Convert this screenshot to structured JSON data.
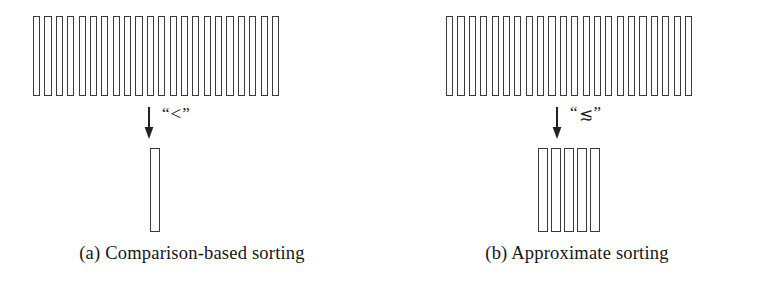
{
  "figure": {
    "background_color": "#ffffff",
    "ink_color": "#3a3a3a",
    "panels": [
      {
        "id": "a",
        "caption": "(a) Comparison-based sorting",
        "input_bar_count": 22,
        "output_bar_count": 1,
        "arrow_icon": "down-arrow-icon",
        "relation_open_quote": "“",
        "relation_symbol": "<",
        "relation_close_quote": "”",
        "relation_label": "“<”"
      },
      {
        "id": "b",
        "caption": "(b) Approximate sorting",
        "input_bar_count": 22,
        "output_bar_count": 5,
        "arrow_icon": "down-arrow-icon",
        "relation_open_quote": "“",
        "relation_symbol": "≲",
        "relation_close_quote": "”",
        "relation_label": "“≲”"
      }
    ]
  },
  "chart_data": {
    "type": "bar",
    "title": "",
    "xlabel": "",
    "ylabel": "",
    "series": [
      {
        "name": "(a) input array",
        "values": [
          80,
          80,
          80,
          80,
          80,
          80,
          80,
          80,
          80,
          80,
          80,
          80,
          80,
          80,
          80,
          80,
          80,
          80,
          80,
          80,
          80,
          80
        ]
      },
      {
        "name": "(a) output array",
        "values": [
          84
        ]
      },
      {
        "name": "(b) input array",
        "values": [
          80,
          80,
          80,
          80,
          80,
          80,
          80,
          80,
          80,
          80,
          80,
          80,
          80,
          80,
          80,
          80,
          80,
          80,
          80,
          80,
          80,
          80
        ]
      },
      {
        "name": "(b) output array",
        "values": [
          84,
          84,
          84,
          84,
          84
        ]
      }
    ]
  }
}
